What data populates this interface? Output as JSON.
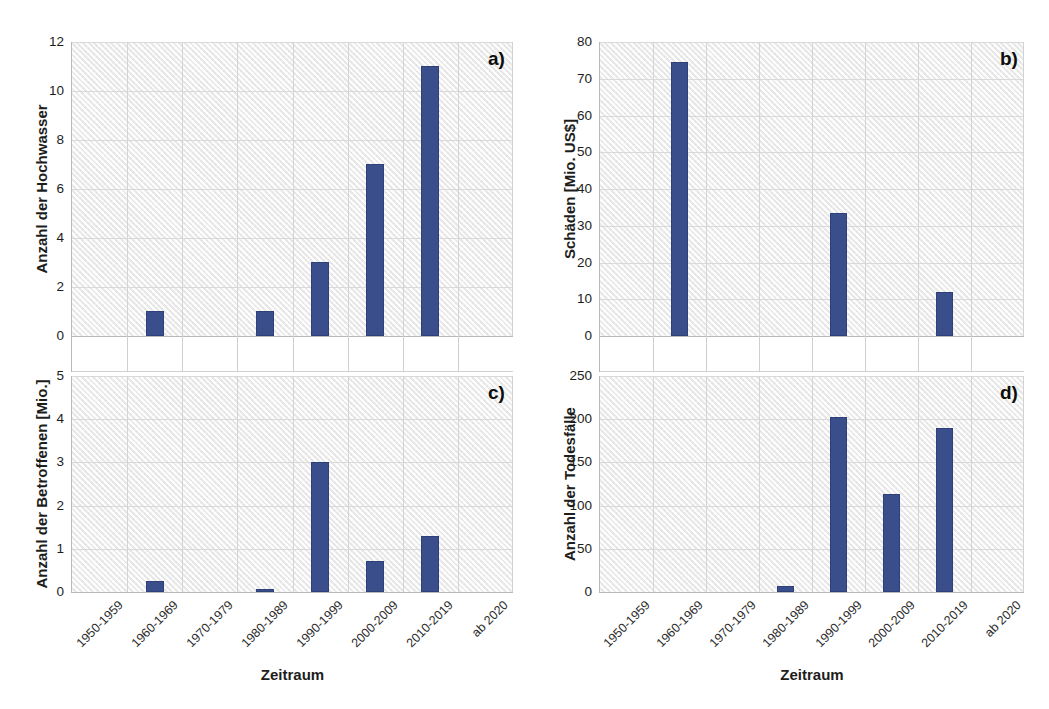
{
  "figure": {
    "xlabel": "Zeitraum",
    "categories": [
      "1950-1959",
      "1960-1969",
      "1970-1979",
      "1980-1989",
      "1990-1999",
      "2000-2009",
      "2010-2019",
      "ab 2020"
    ],
    "bar_color": "#3a4e8c",
    "plot_background": "#f2f2f2"
  },
  "chart_data": [
    {
      "type": "bar",
      "panel": "a)",
      "title": "",
      "xlabel": "Zeitraum",
      "ylabel": "Anzahl der Hochwasser",
      "categories": [
        "1950-1959",
        "1960-1969",
        "1970-1979",
        "1980-1989",
        "1990-1999",
        "2000-2009",
        "2010-2019",
        "ab 2020"
      ],
      "values": [
        0,
        1,
        0,
        1,
        3,
        7,
        11,
        0
      ],
      "yticks": [
        "0",
        "2",
        "4",
        "6",
        "8",
        "10",
        "12"
      ],
      "ylim": [
        0,
        12
      ],
      "grid": true,
      "legend": "none"
    },
    {
      "type": "bar",
      "panel": "b)",
      "title": "",
      "xlabel": "Zeitraum",
      "ylabel": "Schäden [Mio. US$]",
      "categories": [
        "1950-1959",
        "1960-1969",
        "1970-1979",
        "1980-1989",
        "1990-1999",
        "2000-2009",
        "2010-2019",
        "ab 2020"
      ],
      "values": [
        0,
        74.5,
        0,
        0,
        33.5,
        0,
        12,
        0
      ],
      "yticks": [
        "0",
        "10",
        "20",
        "30",
        "40",
        "50",
        "60",
        "70",
        "80"
      ],
      "ylim": [
        0,
        80
      ],
      "grid": true,
      "legend": "none"
    },
    {
      "type": "bar",
      "panel": "c)",
      "title": "",
      "xlabel": "Zeitraum",
      "ylabel": "Anzahl der Betroffenen [Mio.]",
      "categories": [
        "1950-1959",
        "1960-1969",
        "1970-1979",
        "1980-1989",
        "1990-1999",
        "2000-2009",
        "2010-2019",
        "ab 2020"
      ],
      "values": [
        0,
        0.25,
        0,
        0.03,
        3.0,
        0.72,
        1.3,
        0
      ],
      "yticks": [
        "0",
        "1",
        "2",
        "3",
        "4",
        "5"
      ],
      "ylim": [
        0,
        5
      ],
      "grid": true,
      "legend": "none"
    },
    {
      "type": "bar",
      "panel": "d)",
      "title": "",
      "xlabel": "Zeitraum",
      "ylabel": "Anzahl der Todesfälle",
      "categories": [
        "1950-1959",
        "1960-1969",
        "1970-1979",
        "1980-1989",
        "1990-1999",
        "2000-2009",
        "2010-2019",
        "ab 2020"
      ],
      "values": [
        0,
        0,
        0,
        7,
        203,
        113,
        190,
        0
      ],
      "yticks": [
        "0",
        "50",
        "100",
        "150",
        "200",
        "250"
      ],
      "ylim": [
        0,
        250
      ],
      "grid": true,
      "legend": "none"
    }
  ]
}
